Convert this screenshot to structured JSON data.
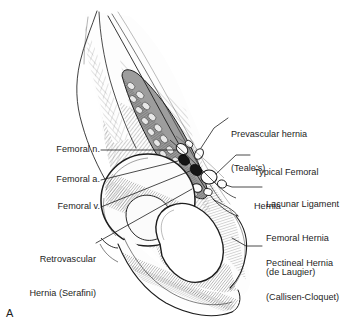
{
  "figure": {
    "panel_label": "A",
    "style": "black-and-white-line-drawing",
    "ink_color": "#1d1d1d",
    "background_color": "#ffffff"
  },
  "labels_left": [
    {
      "name": "femoral-nerve",
      "text": "Femoral n."
    },
    {
      "name": "femoral-artery",
      "text": "Femoral a."
    },
    {
      "name": "femoral-vein",
      "text": "Femoral v."
    },
    {
      "name": "retrovascular-hernia",
      "line1": "Retrovascular",
      "line2": "Hernia (Serafini)"
    }
  ],
  "labels_right": [
    {
      "name": "prevascular-hernia",
      "line1": "Prevascular hernia",
      "line2": "(Teale's)"
    },
    {
      "name": "typical-femoral-hernia",
      "line1": "Typical Femoral",
      "line2": "Hernia"
    },
    {
      "name": "lacunar-ligament-hernia",
      "line1": "Lacunar Ligament",
      "line2": "Femoral Hernia",
      "line3": "(de Laugier)"
    },
    {
      "name": "pectineal-hernia",
      "line1": "Pectineal Hernia",
      "line2": "(Callisen-Cloquet)"
    }
  ],
  "structures": [
    {
      "name": "iliac-crest"
    },
    {
      "name": "iliopsoas-muscle"
    },
    {
      "name": "acetabulum"
    },
    {
      "name": "obturator-foramen"
    },
    {
      "name": "pubic-tubercle"
    },
    {
      "name": "inguinal-ligament"
    },
    {
      "name": "vessel-cluster"
    }
  ]
}
